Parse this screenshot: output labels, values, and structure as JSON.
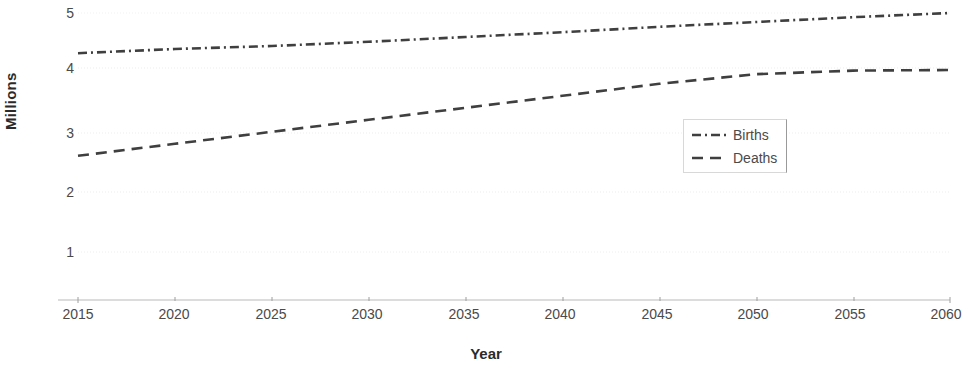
{
  "chart_data": {
    "type": "line",
    "title": "",
    "xlabel": "Year",
    "ylabel": "Millions",
    "xlim": [
      2015,
      2060
    ],
    "ylim": [
      0,
      5.2
    ],
    "grid": true,
    "legend_position": "center-right",
    "xticks": [
      "2015",
      "2020",
      "2025",
      "2030",
      "2035",
      "2040",
      "2045",
      "2050",
      "2055",
      "2060"
    ],
    "yticks": [
      "1",
      "2",
      "3",
      "4",
      "5"
    ],
    "x": [
      2015,
      2020,
      2025,
      2030,
      2035,
      2040,
      2045,
      2050,
      2055,
      2060
    ],
    "series": [
      {
        "name": "Births",
        "style": "dash-dot",
        "color": "#3f3f3f",
        "values": [
          4.33,
          4.4,
          4.45,
          4.52,
          4.6,
          4.68,
          4.77,
          4.85,
          4.93,
          5.0
        ]
      },
      {
        "name": "Deaths",
        "style": "dashed",
        "color": "#3f3f3f",
        "values": [
          2.62,
          2.82,
          3.02,
          3.22,
          3.42,
          3.62,
          3.82,
          3.98,
          4.04,
          4.05
        ]
      }
    ]
  },
  "axis": {
    "y_label": "Millions",
    "x_label": "Year",
    "y_ticks": [
      "5",
      "4",
      "3",
      "2",
      "1"
    ],
    "x_ticks": [
      "2015",
      "2020",
      "2025",
      "2030",
      "2035",
      "2040",
      "2045",
      "2050",
      "2055",
      "2060"
    ]
  },
  "legend": {
    "items": [
      {
        "label": "Births"
      },
      {
        "label": "Deaths"
      }
    ]
  },
  "colors": {
    "line": "#3f3f3f",
    "grid": "#ececec",
    "axis": "#b9b9b9",
    "text": "#4a4a4a"
  }
}
